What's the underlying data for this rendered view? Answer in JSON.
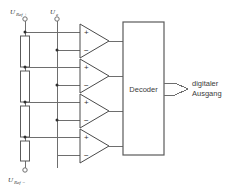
{
  "diagram": {
    "type": "flash-adc-schematic",
    "terminals": [
      {
        "id": "vref_plus",
        "symbol": "U",
        "subscript": "Ref +",
        "x": 25,
        "y": 23
      },
      {
        "id": "vin",
        "symbol": "U",
        "subscript": "e",
        "x": 57,
        "y": 23
      },
      {
        "id": "vref_minus",
        "symbol": "U",
        "subscript": "Ref −",
        "x": 25,
        "y": 166
      }
    ],
    "labels": {
      "vref_plus": "U",
      "vref_plus_sub": "Ref +",
      "vin": "U",
      "vin_sub": "e",
      "vref_minus": "U",
      "vref_minus_sub": "Ref −",
      "decoder": "Decoder",
      "output_line1": "digitaler",
      "output_line2": "Ausgang",
      "plus_sign": "+",
      "minus_sign": "−"
    },
    "resistors": [
      {
        "id": "r1",
        "x": 25,
        "y_top": 36,
        "y_bottom": 67
      },
      {
        "id": "r2",
        "x": 25,
        "y_top": 71,
        "y_bottom": 102
      },
      {
        "id": "r3",
        "x": 25,
        "y_top": 106,
        "y_bottom": 137
      },
      {
        "id": "r4",
        "x": 25,
        "y_top": 141,
        "y_bottom": 161
      }
    ],
    "comparators": [
      {
        "id": "comp1",
        "x": 80,
        "y_center": 41,
        "plus_y": 32,
        "minus_y": 50,
        "out_y": 41
      },
      {
        "id": "comp2",
        "x": 80,
        "y_center": 76,
        "plus_y": 67,
        "minus_y": 85,
        "out_y": 76
      },
      {
        "id": "comp3",
        "x": 80,
        "y_center": 111,
        "plus_y": 102,
        "minus_y": 120,
        "out_y": 111
      },
      {
        "id": "comp4",
        "x": 80,
        "y_center": 146,
        "plus_y": 137,
        "minus_y": 155,
        "out_y": 146
      }
    ],
    "decoder_block": {
      "x": 123,
      "y": 22,
      "width": 41,
      "height": 133
    },
    "colors": {
      "wire": "#6e6e6e",
      "outline": "#5a5a5a",
      "text": "#3a3a3a",
      "node": "#2f2f2f",
      "background": "#ffffff"
    }
  }
}
